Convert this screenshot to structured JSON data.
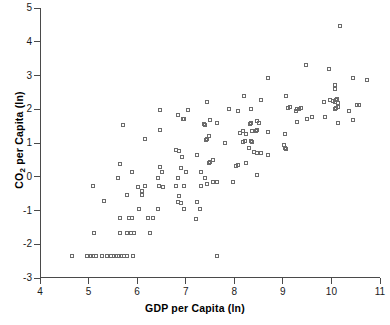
{
  "chart_data": {
    "type": "scatter",
    "title": "",
    "xlabel": "GDP per Capita (ln)",
    "ylabel_prefix": "CO",
    "ylabel_sub": "2",
    "ylabel_suffix": " per Capita (ln)",
    "ylabel_plain": "CO2 per Capita (ln)",
    "xlim": [
      4,
      11
    ],
    "ylim": [
      -3,
      5
    ],
    "xticks": [
      4,
      5,
      6,
      7,
      8,
      9,
      10,
      11
    ],
    "yticks": [
      -3,
      -2,
      -1,
      0,
      1,
      2,
      3,
      4,
      5
    ],
    "grid": false,
    "legend": false,
    "marker": "open-square",
    "marker_color": "#6b6b6b",
    "axis_color": "#4a4a4a",
    "background": "#ffffff",
    "series": [
      {
        "name": "Countries",
        "points": [
          [
            4.63,
            -2.35
          ],
          [
            4.95,
            -2.35
          ],
          [
            5.02,
            -2.35
          ],
          [
            5.08,
            -2.35
          ],
          [
            5.13,
            -2.35
          ],
          [
            5.25,
            -2.35
          ],
          [
            5.35,
            -2.35
          ],
          [
            5.45,
            -2.35
          ],
          [
            5.5,
            -2.35
          ],
          [
            5.55,
            -2.35
          ],
          [
            5.6,
            -2.35
          ],
          [
            5.65,
            -2.35
          ],
          [
            5.7,
            -2.35
          ],
          [
            5.78,
            -2.35
          ],
          [
            5.9,
            -2.35
          ],
          [
            7.62,
            -2.35
          ],
          [
            5.1,
            -1.67
          ],
          [
            5.62,
            -1.67
          ],
          [
            5.78,
            -1.67
          ],
          [
            5.85,
            -1.67
          ],
          [
            5.92,
            -1.67
          ],
          [
            6.25,
            -1.67
          ],
          [
            5.62,
            -1.23
          ],
          [
            5.82,
            -1.23
          ],
          [
            5.88,
            -1.23
          ],
          [
            6.2,
            -1.23
          ],
          [
            6.3,
            -1.23
          ],
          [
            7.2,
            -1.25
          ],
          [
            6.02,
            -0.95
          ],
          [
            6.4,
            -0.97
          ],
          [
            6.95,
            -0.95
          ],
          [
            7.28,
            -0.95
          ],
          [
            5.3,
            -0.73
          ],
          [
            6.82,
            -0.75
          ],
          [
            6.88,
            -0.77
          ],
          [
            7.22,
            -0.75
          ],
          [
            5.78,
            -0.55
          ],
          [
            6.08,
            -0.55
          ],
          [
            6.85,
            -0.57
          ],
          [
            5.08,
            -0.27
          ],
          [
            6.0,
            -0.3
          ],
          [
            6.15,
            -0.28
          ],
          [
            6.42,
            -0.28
          ],
          [
            6.52,
            -0.3
          ],
          [
            6.78,
            -0.28
          ],
          [
            6.95,
            -0.28
          ],
          [
            7.3,
            -0.27
          ],
          [
            7.42,
            -0.22
          ],
          [
            7.55,
            -0.17
          ],
          [
            7.62,
            -0.17
          ],
          [
            7.95,
            -0.17
          ],
          [
            6.08,
            -0.42
          ],
          [
            5.58,
            -0.03
          ],
          [
            6.4,
            -0.03
          ],
          [
            6.82,
            -0.05
          ],
          [
            7.38,
            -0.05
          ],
          [
            5.88,
            0.13
          ],
          [
            6.5,
            0.13
          ],
          [
            6.98,
            0.15
          ],
          [
            7.3,
            0.13
          ],
          [
            5.62,
            0.38
          ],
          [
            6.88,
            0.25
          ],
          [
            7.45,
            0.4
          ],
          [
            7.48,
            0.45
          ],
          [
            7.55,
            0.5
          ],
          [
            8.02,
            0.32
          ],
          [
            8.05,
            0.35
          ],
          [
            8.45,
            0.05
          ],
          [
            6.45,
            0.3
          ],
          [
            6.9,
            0.6
          ],
          [
            7.22,
            0.65
          ],
          [
            8.22,
            0.42
          ],
          [
            6.78,
            0.8
          ],
          [
            6.85,
            0.77
          ],
          [
            8.28,
            0.85
          ],
          [
            8.38,
            0.72
          ],
          [
            8.45,
            0.7
          ],
          [
            8.52,
            0.7
          ],
          [
            9.02,
            0.85
          ],
          [
            9.05,
            0.82
          ],
          [
            8.68,
            0.65
          ],
          [
            9.0,
            0.95
          ],
          [
            6.15,
            1.12
          ],
          [
            7.78,
            1.0
          ],
          [
            8.15,
            1.02
          ],
          [
            8.2,
            1.05
          ],
          [
            8.35,
            1.02
          ],
          [
            7.4,
            1.08
          ],
          [
            7.42,
            1.12
          ],
          [
            8.32,
            1.05
          ],
          [
            7.45,
            1.22
          ],
          [
            8.1,
            1.3
          ],
          [
            8.15,
            1.35
          ],
          [
            8.22,
            1.28
          ],
          [
            8.35,
            1.35
          ],
          [
            8.42,
            1.35
          ],
          [
            8.45,
            1.38
          ],
          [
            8.68,
            1.32
          ],
          [
            9.02,
            1.28
          ],
          [
            6.45,
            1.38
          ],
          [
            5.68,
            1.52
          ],
          [
            7.35,
            1.55
          ],
          [
            7.38,
            1.52
          ],
          [
            7.62,
            1.58
          ],
          [
            7.48,
            1.68
          ],
          [
            8.3,
            1.55
          ],
          [
            8.32,
            1.58
          ],
          [
            8.45,
            1.65
          ],
          [
            8.48,
            1.6
          ],
          [
            9.28,
            1.62
          ],
          [
            9.48,
            1.72
          ],
          [
            9.58,
            1.78
          ],
          [
            10.12,
            1.6
          ],
          [
            10.42,
            1.68
          ],
          [
            6.92,
            1.7
          ],
          [
            6.95,
            1.72
          ],
          [
            6.82,
            1.82
          ],
          [
            6.45,
            1.97
          ],
          [
            7.02,
            1.97
          ],
          [
            7.88,
            2.02
          ],
          [
            8.05,
            1.95
          ],
          [
            8.32,
            2.02
          ],
          [
            9.08,
            2.05
          ],
          [
            9.12,
            2.08
          ],
          [
            9.25,
            1.95
          ],
          [
            9.28,
            2.02
          ],
          [
            9.32,
            2.02
          ],
          [
            9.35,
            2.05
          ],
          [
            9.85,
            1.78
          ],
          [
            10.05,
            2.0
          ],
          [
            10.08,
            2.05
          ],
          [
            10.12,
            2.08
          ],
          [
            10.35,
            1.95
          ],
          [
            10.5,
            2.12
          ],
          [
            10.55,
            2.12
          ],
          [
            7.42,
            2.22
          ],
          [
            8.18,
            2.4
          ],
          [
            8.52,
            2.28
          ],
          [
            9.05,
            2.4
          ],
          [
            9.82,
            2.22
          ],
          [
            9.95,
            2.28
          ],
          [
            10.02,
            2.25
          ],
          [
            10.05,
            2.22
          ],
          [
            10.08,
            2.28
          ],
          [
            10.1,
            2.3
          ],
          [
            10.12,
            2.18
          ],
          [
            10.05,
            2.6
          ],
          [
            10.05,
            2.72
          ],
          [
            8.68,
            2.92
          ],
          [
            10.42,
            2.92
          ],
          [
            10.72,
            2.88
          ],
          [
            9.92,
            3.18
          ],
          [
            9.45,
            3.32
          ],
          [
            10.15,
            4.47
          ]
        ]
      }
    ]
  },
  "axis_titles": {
    "x": "GDP per Capita (ln)"
  }
}
